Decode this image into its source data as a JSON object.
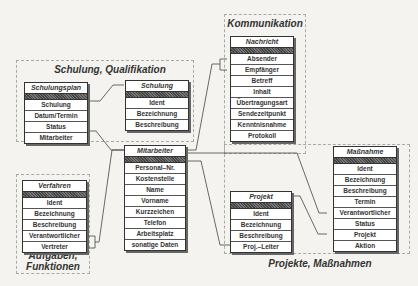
{
  "groups": {
    "schulung": {
      "label": "Schulung, Qualifikation"
    },
    "kommunikation": {
      "label": "Kommunikation"
    },
    "aufgaben": {
      "label": "Aufgaben,\nFunktionen",
      "line1": "Aufgaben,",
      "line2": "Funktionen"
    },
    "projekte": {
      "label": "Projekte, Maßnahmen"
    }
  },
  "entities": {
    "schulungsplan": {
      "title": "Schulungsplan",
      "fields": [
        "Schulung",
        "Datum/Termin",
        "Status",
        "Mitarbeiter"
      ]
    },
    "schulung": {
      "title": "Schulung",
      "fields": [
        "Ident",
        "Bezeichnung",
        "Beschreibung"
      ]
    },
    "nachricht": {
      "title": "Nachricht",
      "fields": [
        "Absender",
        "Empfänger",
        "Betreff",
        "Inhalt",
        "Übertragungsart",
        "Sendezeitpunkt",
        "Kenntnisnahme",
        "Protokoll"
      ]
    },
    "mitarbeiter": {
      "title": "Mitarbeiter",
      "fields": [
        "Personal–Nr.",
        "Kostenstelle",
        "Name",
        "Vorname",
        "Kurzzeichen",
        "Telefon",
        "Arbeitsplatz",
        "sonatige Daten"
      ]
    },
    "verfahren": {
      "title": "Verfahren",
      "fields": [
        "Ident",
        "Bezeichnung",
        "Beschreibung",
        "Verantwortlicher",
        "Vertreter"
      ]
    },
    "projekt": {
      "title": "Projekt",
      "fields": [
        "Ident",
        "Bezeichnung",
        "Beschreibung",
        "Proj.–Leiter"
      ]
    },
    "massnahme": {
      "title": "Maßnahme",
      "fields": [
        "Ident",
        "Bezeichnung",
        "Beschreibung",
        "Termin",
        "Verantwortlicher",
        "Status",
        "Projekt",
        "Aktion"
      ]
    }
  },
  "relations": [
    {
      "from": "Schulungsplan.Schulung",
      "to": "Schulung"
    },
    {
      "from": "Schulungsplan.Mitarbeiter",
      "to": "Mitarbeiter"
    },
    {
      "from": "Nachricht.Absender",
      "to": "Mitarbeiter"
    },
    {
      "from": "Nachricht.Empfänger",
      "to": "Mitarbeiter"
    },
    {
      "from": "Verfahren.Verantwortlicher",
      "to": "Mitarbeiter"
    },
    {
      "from": "Verfahren.Vertreter",
      "to": "Mitarbeiter"
    },
    {
      "from": "Projekt.Proj.–Leiter",
      "to": "Mitarbeiter"
    },
    {
      "from": "Maßnahme.Verantwortlicher",
      "to": "Mitarbeiter"
    },
    {
      "from": "Maßnahme.Projekt",
      "to": "Projekt"
    }
  ]
}
